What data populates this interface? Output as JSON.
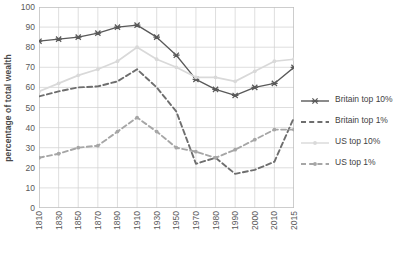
{
  "chart_data": {
    "type": "line",
    "title": "",
    "xlabel": "",
    "ylabel": "percentage of total wealth",
    "ylim": [
      0,
      100
    ],
    "yticks": [
      0,
      10,
      20,
      30,
      40,
      50,
      60,
      70,
      80,
      90,
      100
    ],
    "grid": true,
    "legend_position": "right",
    "categories": [
      "1810",
      "1830",
      "1850",
      "1870",
      "1890",
      "1910",
      "1930",
      "1950",
      "1970",
      "1980",
      "1990",
      "2000",
      "2010",
      "2015"
    ],
    "series": [
      {
        "name": "Britain top 10%",
        "color": "#595959",
        "style": "solid",
        "marker": "x",
        "values": [
          83,
          84,
          85,
          87,
          90,
          91,
          85,
          76,
          64,
          59,
          56,
          60,
          62,
          70
        ]
      },
      {
        "name": "Britain top 1%",
        "color": "#6e6e6e",
        "style": "dashed",
        "marker": "none",
        "values": [
          55.5,
          58,
          60,
          60.5,
          63,
          69,
          60,
          48,
          22,
          25,
          17,
          19,
          23,
          45
        ]
      },
      {
        "name": "US top 10%",
        "color": "#d9d9d9",
        "style": "solid",
        "marker": "dot",
        "values": [
          58,
          62,
          66,
          69,
          73,
          80,
          74,
          70,
          65,
          65,
          63,
          68,
          73,
          74
        ]
      },
      {
        "name": "US top 1%",
        "color": "#a6a6a6",
        "style": "dashed",
        "marker": "dot",
        "values": [
          25,
          27,
          30,
          31,
          38,
          45,
          38,
          30,
          28,
          25,
          29,
          34,
          39,
          39
        ]
      }
    ]
  },
  "legend": {
    "items": [
      {
        "label": "Britain top 10%"
      },
      {
        "label": "Britain top 1%"
      },
      {
        "label": "US top 10%"
      },
      {
        "label": "US top 1%"
      }
    ]
  },
  "axes": {
    "y_title": "percentage of total wealth"
  },
  "colors": {
    "grid": "#d0d0d0",
    "frame": "#bfbfbf",
    "tick_text": "#595959",
    "britain_top10": "#595959",
    "britain_top1": "#6e6e6e",
    "us_top10": "#d9d9d9",
    "us_top1": "#a6a6a6"
  }
}
